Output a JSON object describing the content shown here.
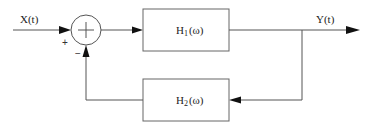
{
  "diagram": {
    "type": "feedback-block-diagram",
    "input": {
      "label": "X(t)"
    },
    "output": {
      "label": "Y(t)"
    },
    "summing_junction": {
      "symbol": "+",
      "input_sign": "+",
      "feedback_sign": "−"
    },
    "forward_block": {
      "name": "H",
      "subscript": "1",
      "arg": "(ω)"
    },
    "feedback_block": {
      "name": "H",
      "subscript": "2",
      "arg": "(ω)"
    }
  }
}
